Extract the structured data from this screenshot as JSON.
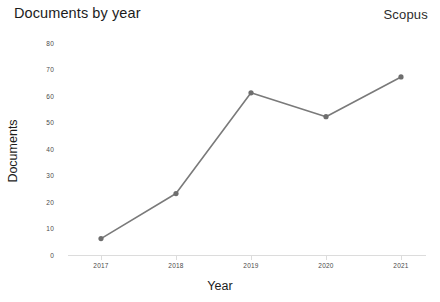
{
  "header": {
    "title": "Documents by year",
    "brand": "Scopus"
  },
  "chart_data": {
    "type": "line",
    "title": "Documents by year",
    "xlabel": "Year",
    "ylabel": "Documents",
    "categories": [
      "2017",
      "2018",
      "2019",
      "2020",
      "2021"
    ],
    "values": [
      6,
      23,
      61,
      52,
      67
    ],
    "series": [
      {
        "name": "Documents",
        "values": [
          6,
          23,
          61,
          52,
          67
        ]
      }
    ],
    "ylim": [
      0,
      80
    ],
    "yticks": [
      0,
      10,
      20,
      30,
      40,
      50,
      60,
      70,
      80
    ],
    "ytick_labels": [
      "0",
      "10",
      "20",
      "30",
      "40",
      "50",
      "60",
      "70",
      "80"
    ],
    "grid": false,
    "legend": "none",
    "line_color": "#7a7a7a",
    "marker_color": "#6e6e6e",
    "axis_color": "#dcdcdc",
    "background": "#ffffff"
  }
}
